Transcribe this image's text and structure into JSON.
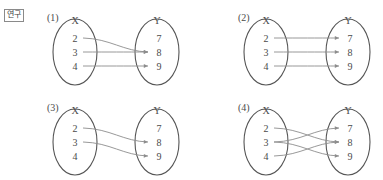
{
  "worksheet": {
    "badge_label": "연구",
    "domain_label": "X",
    "codomain_label": "Y",
    "domain_elements": [
      "2",
      "3",
      "4"
    ],
    "codomain_elements": [
      "7",
      "8",
      "9"
    ],
    "line_color": "#8d8d8d",
    "oval_color": "#555555",
    "text_color": "#4a4a4a"
  },
  "panels": [
    {
      "number": "(1)",
      "domain_label": "X",
      "codomain_label": "Y",
      "domain_elements": [
        "2",
        "3",
        "4"
      ],
      "codomain_elements": [
        "7",
        "8",
        "9"
      ],
      "arrows": [
        {
          "from": "2",
          "to": "8"
        },
        {
          "from": "3",
          "to": "8"
        },
        {
          "from": "4",
          "to": "9"
        }
      ]
    },
    {
      "number": "(2)",
      "domain_label": "X",
      "codomain_label": "Y",
      "domain_elements": [
        "2",
        "3",
        "4"
      ],
      "codomain_elements": [
        "7",
        "8",
        "9"
      ],
      "arrows": [
        {
          "from": "2",
          "to": "7"
        },
        {
          "from": "3",
          "to": "8"
        },
        {
          "from": "4",
          "to": "9"
        }
      ]
    },
    {
      "number": "(3)",
      "domain_label": "X",
      "codomain_label": "Y",
      "domain_elements": [
        "2",
        "3",
        "4"
      ],
      "codomain_elements": [
        "7",
        "8",
        "9"
      ],
      "arrows": [
        {
          "from": "2",
          "to": "8"
        },
        {
          "from": "3",
          "to": "9"
        }
      ]
    },
    {
      "number": "(4)",
      "domain_label": "X",
      "codomain_label": "Y",
      "domain_elements": [
        "2",
        "3",
        "4"
      ],
      "codomain_elements": [
        "7",
        "8",
        "9"
      ],
      "arrows": [
        {
          "from": "2",
          "to": "8"
        },
        {
          "from": "3",
          "to": "7"
        },
        {
          "from": "3",
          "to": "9"
        },
        {
          "from": "4",
          "to": "8"
        }
      ]
    }
  ]
}
